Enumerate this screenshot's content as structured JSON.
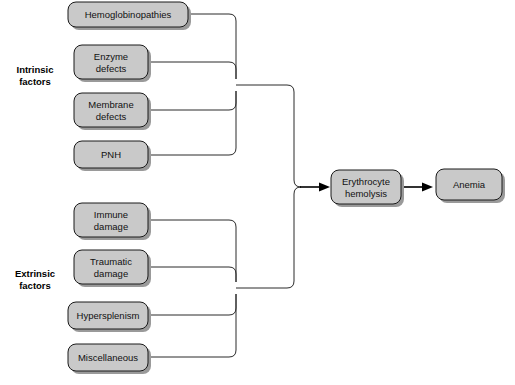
{
  "diagram": {
    "type": "flowchart",
    "colors": {
      "node_fill": "#c9c9c9",
      "node_stroke": "#1a1a1a",
      "node_shadow": "#9a9a9a",
      "connector": "#2b2b2b",
      "arrow": "#000000",
      "background": "#ffffff",
      "text": "#111111"
    },
    "groups": [
      {
        "id": "intrinsic",
        "label_line1": "Intrinsic",
        "label_line2": "factors"
      },
      {
        "id": "extrinsic",
        "label_line1": "Extrinsic",
        "label_line2": "factors"
      }
    ],
    "nodes": {
      "hemoglobinopathies": {
        "line1": "Hemoglobinopathies",
        "line2": ""
      },
      "enzyme_defects": {
        "line1": "Enzyme",
        "line2": "defects"
      },
      "membrane_defects": {
        "line1": "Membrane",
        "line2": "defects"
      },
      "pnh": {
        "line1": "PNH",
        "line2": ""
      },
      "immune_damage": {
        "line1": "Immune",
        "line2": "damage"
      },
      "traumatic_damage": {
        "line1": "Traumatic",
        "line2": "damage"
      },
      "hypersplenism": {
        "line1": "Hypersplenism",
        "line2": ""
      },
      "miscellaneous": {
        "line1": "Miscellaneous",
        "line2": ""
      },
      "erythrocyte_hemolysis": {
        "line1": "Erythrocyte",
        "line2": "hemolysis"
      },
      "anemia": {
        "line1": "Anemia",
        "line2": ""
      }
    },
    "edges": [
      {
        "from": "hemoglobinopathies",
        "to": "intrinsic-junction"
      },
      {
        "from": "enzyme_defects",
        "to": "intrinsic-junction"
      },
      {
        "from": "membrane_defects",
        "to": "intrinsic-junction"
      },
      {
        "from": "pnh",
        "to": "intrinsic-junction"
      },
      {
        "from": "immune_damage",
        "to": "extrinsic-junction"
      },
      {
        "from": "traumatic_damage",
        "to": "extrinsic-junction"
      },
      {
        "from": "hypersplenism",
        "to": "extrinsic-junction"
      },
      {
        "from": "miscellaneous",
        "to": "extrinsic-junction"
      },
      {
        "from": "intrinsic-junction",
        "to": "erythrocyte_hemolysis"
      },
      {
        "from": "extrinsic-junction",
        "to": "erythrocyte_hemolysis"
      },
      {
        "from": "erythrocyte_hemolysis",
        "to": "anemia"
      }
    ]
  }
}
